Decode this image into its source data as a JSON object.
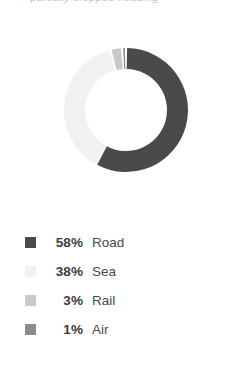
{
  "header": {
    "title_fragment": "partially cropped heading"
  },
  "chart_data": {
    "type": "pie",
    "variant": "donut",
    "title": "",
    "xlabel": "",
    "ylabel": "",
    "legend_position": "bottom-left",
    "grid": false,
    "start_angle_deg": -90,
    "direction": "clockwise",
    "gap_deg": 2,
    "categories": [
      "Road",
      "Sea",
      "Rail",
      "Air"
    ],
    "values": [
      58,
      38,
      3,
      1
    ],
    "value_unit": "%",
    "colors": [
      "#4a4a4a",
      "#f1f1f1",
      "#c9c9c9",
      "#8c8c8c"
    ],
    "slices": [
      {
        "label": "Road",
        "value": 58,
        "display": "58%",
        "color": "#4a4a4a"
      },
      {
        "label": "Sea",
        "value": 38,
        "display": "38%",
        "color": "#f1f1f1"
      },
      {
        "label": "Rail",
        "value": 3,
        "display": "3%",
        "color": "#c9c9c9"
      },
      {
        "label": "Air",
        "value": 1,
        "display": "1%",
        "color": "#8c8c8c"
      }
    ],
    "geometry": {
      "center_x": 65,
      "center_y": 88,
      "outer_radius": 62,
      "inner_radius": 41
    }
  },
  "legend": {
    "items": [
      {
        "pct": "58%",
        "label": "Road",
        "color": "#4a4a4a"
      },
      {
        "pct": "38%",
        "label": "Sea",
        "color": "#f1f1f1"
      },
      {
        "pct": "3%",
        "label": "Rail",
        "color": "#c9c9c9"
      },
      {
        "pct": "1%",
        "label": "Air",
        "color": "#8c8c8c"
      }
    ]
  }
}
